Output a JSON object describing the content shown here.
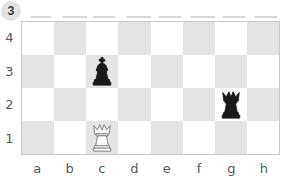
{
  "exercise": {
    "number": "3",
    "badge_bg": "#e2e2e2",
    "badge_fg": "#3c3c3c"
  },
  "board": {
    "files": [
      "a",
      "b",
      "c",
      "d",
      "e",
      "f",
      "g",
      "h"
    ],
    "ranks": [
      "4",
      "3",
      "2",
      "1"
    ],
    "light_square_color": "#ffffff",
    "dark_square_color": "#e4e4e4",
    "border_color": "#c9c9c9",
    "label_color": "#55585c",
    "files_count": 8,
    "ranks_count": 4,
    "orientation": "white-bottom",
    "squares": [
      [
        {
          "id": "a4",
          "shade": "light",
          "piece": null
        },
        {
          "id": "b4",
          "shade": "dark",
          "piece": null
        },
        {
          "id": "c4",
          "shade": "light",
          "piece": null
        },
        {
          "id": "d4",
          "shade": "dark",
          "piece": null
        },
        {
          "id": "e4",
          "shade": "light",
          "piece": null
        },
        {
          "id": "f4",
          "shade": "dark",
          "piece": null
        },
        {
          "id": "g4",
          "shade": "light",
          "piece": null
        },
        {
          "id": "h4",
          "shade": "dark",
          "piece": null
        }
      ],
      [
        {
          "id": "a3",
          "shade": "dark",
          "piece": null
        },
        {
          "id": "b3",
          "shade": "light",
          "piece": null
        },
        {
          "id": "c3",
          "shade": "dark",
          "piece": {
            "type": "king",
            "color": "black",
            "name": "black-king"
          }
        },
        {
          "id": "d3",
          "shade": "light",
          "piece": null
        },
        {
          "id": "e3",
          "shade": "dark",
          "piece": null
        },
        {
          "id": "f3",
          "shade": "light",
          "piece": null
        },
        {
          "id": "g3",
          "shade": "dark",
          "piece": null
        },
        {
          "id": "h3",
          "shade": "light",
          "piece": null
        }
      ],
      [
        {
          "id": "a2",
          "shade": "light",
          "piece": null
        },
        {
          "id": "b2",
          "shade": "dark",
          "piece": null
        },
        {
          "id": "c2",
          "shade": "light",
          "piece": null
        },
        {
          "id": "d2",
          "shade": "dark",
          "piece": null
        },
        {
          "id": "e2",
          "shade": "light",
          "piece": null
        },
        {
          "id": "f2",
          "shade": "dark",
          "piece": null
        },
        {
          "id": "g2",
          "shade": "light",
          "piece": {
            "type": "queen",
            "color": "black",
            "name": "black-queen"
          }
        },
        {
          "id": "h2",
          "shade": "dark",
          "piece": null
        }
      ],
      [
        {
          "id": "a1",
          "shade": "dark",
          "piece": null
        },
        {
          "id": "b1",
          "shade": "light",
          "piece": null
        },
        {
          "id": "c1",
          "shade": "dark",
          "piece": {
            "type": "queen",
            "color": "white",
            "name": "white-queen"
          }
        },
        {
          "id": "d1",
          "shade": "light",
          "piece": null
        },
        {
          "id": "e1",
          "shade": "dark",
          "piece": null
        },
        {
          "id": "f1",
          "shade": "light",
          "piece": null
        },
        {
          "id": "g1",
          "shade": "dark",
          "piece": null
        },
        {
          "id": "h1",
          "shade": "light",
          "piece": null
        }
      ]
    ],
    "pieces_list": [
      {
        "square": "c3",
        "piece": "king",
        "color": "black"
      },
      {
        "square": "g2",
        "piece": "queen",
        "color": "black"
      },
      {
        "square": "c1",
        "piece": "queen",
        "color": "white"
      }
    ]
  },
  "artifacts": {
    "top_ticks": [
      {
        "left": 10,
        "width": 20
      },
      {
        "left": 42,
        "width": 24
      },
      {
        "left": 72,
        "width": 22
      },
      {
        "left": 106,
        "width": 24
      },
      {
        "left": 138,
        "width": 22
      },
      {
        "left": 170,
        "width": 24
      },
      {
        "left": 202,
        "width": 22
      },
      {
        "left": 234,
        "width": 22
      }
    ]
  }
}
